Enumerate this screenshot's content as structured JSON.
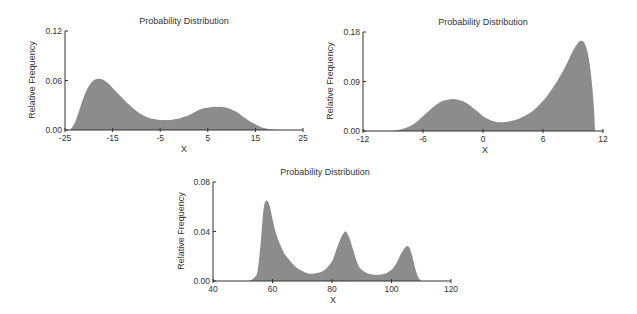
{
  "chart_data": [
    {
      "type": "area",
      "title": "Probability Distribution",
      "xlabel": "X",
      "ylabel": "Relative Frequency",
      "xlim": [
        -25,
        25
      ],
      "ylim": [
        0,
        0.12
      ],
      "xticks": [
        -25,
        -15,
        -5,
        5,
        15,
        25
      ],
      "yticks": [
        "0.00",
        "0.06",
        "0.12"
      ],
      "grid": false,
      "fill_color": "#8c8c8c",
      "x": [
        -24,
        -23,
        -22,
        -21,
        -20,
        -19,
        -18,
        -17,
        -16,
        -15,
        -14,
        -13,
        -12,
        -11,
        -10,
        -9,
        -8,
        -7,
        -6,
        -5,
        -4,
        -3,
        -2,
        -1,
        0,
        1,
        2,
        3,
        4,
        5,
        6,
        7,
        8,
        9,
        10,
        11,
        12,
        13,
        14,
        15,
        16,
        17,
        18,
        19,
        20
      ],
      "values": [
        0.0,
        0.008,
        0.024,
        0.041,
        0.053,
        0.06,
        0.062,
        0.061,
        0.057,
        0.051,
        0.045,
        0.039,
        0.033,
        0.028,
        0.023,
        0.019,
        0.016,
        0.014,
        0.013,
        0.012,
        0.012,
        0.012,
        0.013,
        0.014,
        0.016,
        0.018,
        0.021,
        0.024,
        0.026,
        0.027,
        0.028,
        0.028,
        0.028,
        0.027,
        0.025,
        0.022,
        0.018,
        0.014,
        0.01,
        0.007,
        0.004,
        0.002,
        0.001,
        0.0003,
        0.0
      ]
    },
    {
      "type": "area",
      "title": "Probability Distribution",
      "xlabel": "X",
      "ylabel": "Relative Frequency",
      "xlim": [
        -12,
        12
      ],
      "ylim": [
        0,
        0.18
      ],
      "xticks": [
        -12,
        -6,
        0,
        6,
        12
      ],
      "yticks": [
        "0.00",
        "0.09",
        "0.18"
      ],
      "grid": false,
      "fill_color": "#8c8c8c",
      "x": [
        -9,
        -8,
        -7,
        -6,
        -5,
        -4.5,
        -4,
        -3.5,
        -3,
        -2.5,
        -2,
        -1.5,
        -1,
        -0.5,
        0,
        0.5,
        1,
        1.5,
        2,
        2.5,
        3,
        3.5,
        4,
        4.5,
        5,
        5.5,
        6,
        6.5,
        7,
        7.5,
        8,
        8.5,
        9,
        9.5,
        9.8,
        10.2,
        10.6,
        10.9,
        11.1,
        11.2
      ],
      "values": [
        0.0,
        0.004,
        0.012,
        0.027,
        0.043,
        0.05,
        0.055,
        0.057,
        0.058,
        0.057,
        0.054,
        0.049,
        0.042,
        0.035,
        0.027,
        0.022,
        0.018,
        0.016,
        0.016,
        0.017,
        0.019,
        0.022,
        0.026,
        0.031,
        0.037,
        0.045,
        0.055,
        0.066,
        0.079,
        0.093,
        0.109,
        0.127,
        0.146,
        0.16,
        0.164,
        0.158,
        0.13,
        0.085,
        0.04,
        0.0
      ]
    },
    {
      "type": "area",
      "title": "Probability Distribution",
      "xlabel": "X",
      "ylabel": "Relative Frequency",
      "xlim": [
        40,
        120
      ],
      "ylim": [
        0,
        0.08
      ],
      "xticks": [
        40,
        60,
        80,
        100,
        120
      ],
      "yticks": [
        "0.00",
        "0.04",
        "0.08"
      ],
      "grid": false,
      "fill_color": "#8c8c8c",
      "x": [
        52,
        53,
        54,
        55,
        56,
        57,
        58,
        59,
        60,
        61,
        62,
        63,
        64,
        65,
        66,
        68,
        70,
        72,
        74,
        76,
        78,
        80,
        81,
        82,
        83,
        84,
        84.5,
        85,
        86,
        87,
        88,
        89,
        90,
        92,
        94,
        96,
        98,
        100,
        101,
        102,
        103,
        104,
        105,
        105.5,
        106,
        107,
        108,
        109,
        110
      ],
      "values": [
        0.0,
        0.001,
        0.003,
        0.008,
        0.03,
        0.058,
        0.065,
        0.061,
        0.05,
        0.04,
        0.033,
        0.027,
        0.022,
        0.019,
        0.016,
        0.011,
        0.008,
        0.006,
        0.006,
        0.007,
        0.01,
        0.016,
        0.022,
        0.029,
        0.035,
        0.039,
        0.04,
        0.039,
        0.034,
        0.026,
        0.018,
        0.012,
        0.009,
        0.006,
        0.005,
        0.005,
        0.006,
        0.009,
        0.012,
        0.016,
        0.021,
        0.025,
        0.028,
        0.028,
        0.027,
        0.02,
        0.01,
        0.003,
        0.0
      ]
    }
  ],
  "panels": [
    {
      "title": "Probability Distribution",
      "xlabel": "X",
      "ylabel": "Relative Frequency"
    },
    {
      "title": "Probability Distribution",
      "xlabel": "X",
      "ylabel": "Relative Frequency"
    },
    {
      "title": "Probability Distribution",
      "xlabel": "X",
      "ylabel": "Relative Frequency"
    }
  ]
}
